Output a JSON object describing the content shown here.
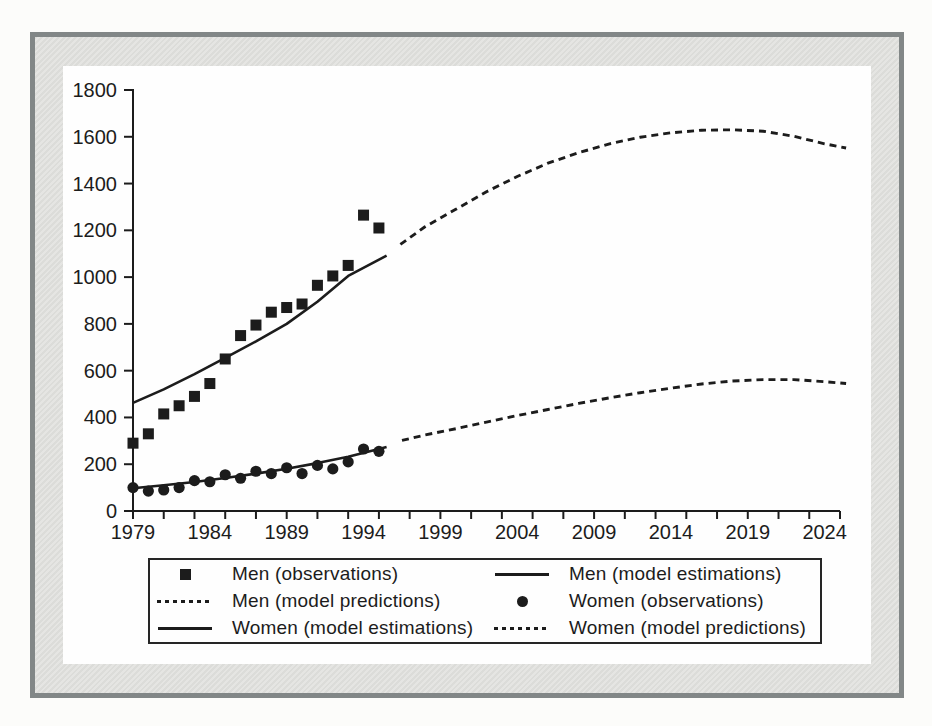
{
  "figure": {
    "ink_color": "#1c1c1c",
    "frame_border_color": "#828787",
    "frame_mat_color": "#e4e4e1",
    "panel_color": "#fefefe",
    "page_color": "#fcfcfa"
  },
  "chart_data": {
    "type": "line",
    "title": "",
    "xlabel": "",
    "ylabel": "",
    "grid": false,
    "x_axis": {
      "min": 1979,
      "max": 2025,
      "minor_tick_step": 2,
      "tick_labels": [
        "1979",
        "1984",
        "1989",
        "1994",
        "1999",
        "2004",
        "2009",
        "2014",
        "2019",
        "2024"
      ],
      "label_values": [
        1979,
        1984,
        1989,
        1994,
        1999,
        2004,
        2009,
        2014,
        2019,
        2024
      ]
    },
    "y_axis": {
      "min": 0,
      "max": 1800,
      "tick_step": 200,
      "tick_labels": [
        "0",
        "200",
        "400",
        "600",
        "800",
        "1000",
        "1200",
        "1400",
        "1600",
        "1800"
      ]
    },
    "series": [
      {
        "name": "Men (observations)",
        "type": "scatter",
        "marker": "square",
        "x": [
          1979,
          1980,
          1981,
          1982,
          1983,
          1984,
          1985,
          1986,
          1987,
          1988,
          1989,
          1990,
          1991,
          1992,
          1993,
          1994,
          1995
        ],
        "y": [
          290,
          330,
          415,
          450,
          490,
          545,
          650,
          750,
          795,
          850,
          870,
          885,
          965,
          1005,
          1050,
          1265,
          1210
        ]
      },
      {
        "name": "Men (model estimations)",
        "type": "line",
        "dash": "solid",
        "points": [
          [
            1979,
            462
          ],
          [
            1981,
            520
          ],
          [
            1983,
            585
          ],
          [
            1985,
            655
          ],
          [
            1987,
            725
          ],
          [
            1989,
            800
          ],
          [
            1991,
            895
          ],
          [
            1993,
            1005
          ],
          [
            1995.5,
            1092
          ]
        ]
      },
      {
        "name": "Men (model predictions)",
        "type": "line",
        "dash": "dashed",
        "points": [
          [
            1996.4,
            1140
          ],
          [
            1998,
            1215
          ],
          [
            2000,
            1290
          ],
          [
            2002,
            1365
          ],
          [
            2004,
            1430
          ],
          [
            2006,
            1487
          ],
          [
            2008,
            1532
          ],
          [
            2010,
            1570
          ],
          [
            2012,
            1598
          ],
          [
            2014,
            1617
          ],
          [
            2016,
            1628
          ],
          [
            2018,
            1630
          ],
          [
            2020,
            1624
          ],
          [
            2022,
            1602
          ],
          [
            2024,
            1570
          ],
          [
            2025.4,
            1552
          ]
        ]
      },
      {
        "name": "Women (observations)",
        "type": "scatter",
        "marker": "circle",
        "x": [
          1979,
          1980,
          1981,
          1982,
          1983,
          1984,
          1985,
          1986,
          1987,
          1988,
          1989,
          1990,
          1991,
          1992,
          1993,
          1994,
          1995
        ],
        "y": [
          100,
          85,
          90,
          100,
          130,
          125,
          155,
          140,
          170,
          160,
          185,
          160,
          195,
          180,
          210,
          265,
          255
        ]
      },
      {
        "name": "Women (model estimations)",
        "type": "line",
        "dash": "solid",
        "points": [
          [
            1979,
            97
          ],
          [
            1981,
            110
          ],
          [
            1983,
            124
          ],
          [
            1985,
            141
          ],
          [
            1987,
            160
          ],
          [
            1989,
            181
          ],
          [
            1991,
            205
          ],
          [
            1993,
            232
          ],
          [
            1995.5,
            273
          ]
        ]
      },
      {
        "name": "Women (model predictions)",
        "type": "line",
        "dash": "dashed",
        "points": [
          [
            1996.5,
            302
          ],
          [
            1998,
            325
          ],
          [
            2000,
            352
          ],
          [
            2002,
            380
          ],
          [
            2004,
            408
          ],
          [
            2006,
            434
          ],
          [
            2008,
            460
          ],
          [
            2010,
            484
          ],
          [
            2012,
            506
          ],
          [
            2014,
            525
          ],
          [
            2016,
            543
          ],
          [
            2018,
            556
          ],
          [
            2020,
            562
          ],
          [
            2022,
            562
          ],
          [
            2024,
            553
          ],
          [
            2025.4,
            545
          ]
        ]
      }
    ],
    "legend": {
      "position": "bottom",
      "entries": [
        {
          "label": "Men (observations)",
          "marker": "square"
        },
        {
          "label": "Men (model estimations)",
          "marker": "solid-line"
        },
        {
          "label": "Men (model predictions)",
          "marker": "dashed-line"
        },
        {
          "label": "Women (observations)",
          "marker": "circle"
        },
        {
          "label": "Women (model estimations)",
          "marker": "solid-line"
        },
        {
          "label": "Women (model predictions)",
          "marker": "dashed-line"
        }
      ]
    }
  }
}
